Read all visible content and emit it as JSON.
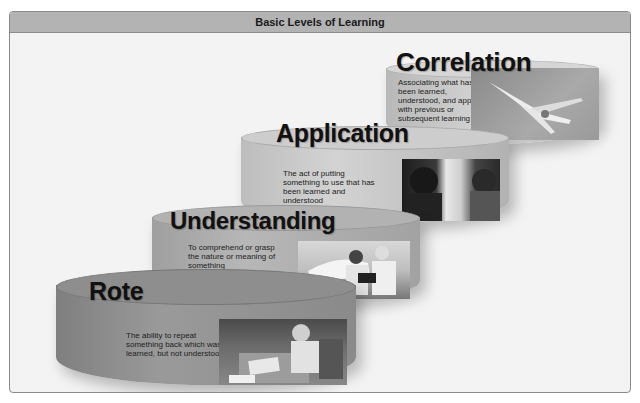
{
  "header": {
    "title": "Basic Levels of Learning"
  },
  "levels": [
    {
      "id": "correlation",
      "title": "Correlation",
      "description": "Associating what has been learned, understood, and applied with previous or subsequent learning",
      "photo": "jet-aircraft-in-flight",
      "color": "#c4c4c4"
    },
    {
      "id": "application",
      "title": "Application",
      "description": "The act of putting something to use that has been learned and understood",
      "photo": "pilots-in-cockpit",
      "color": "#b8b8b8"
    },
    {
      "id": "understanding",
      "title": "Understanding",
      "description": "To comprehend or grasp the nature or meaning of something",
      "photo": "instructor-and-student-by-airplane",
      "color": "#a8a8a8"
    },
    {
      "id": "rote",
      "title": "Rote",
      "description": "The ability to repeat something back which was learned, but not understood",
      "photo": "student-studying-at-desk",
      "color": "#8f8f8f"
    }
  ]
}
